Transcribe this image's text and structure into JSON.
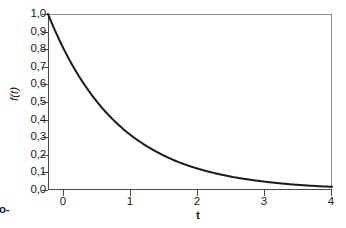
{
  "chart_data": {
    "type": "line",
    "title": "",
    "xlabel": "t",
    "ylabel": "f(t)",
    "xlim": [
      0,
      4
    ],
    "ylim": [
      0.0,
      1.0
    ],
    "grid": false,
    "legend": "none",
    "function": "f(t) = e^(-t)",
    "x_ticks": [
      "0",
      "1",
      "2",
      "3",
      "4"
    ],
    "x_tick_values": [
      0,
      1,
      2,
      3,
      4
    ],
    "y_ticks": [
      "0,0",
      "0,1",
      "0,2",
      "0,3",
      "0,4",
      "0,5",
      "0,6",
      "0,7",
      "0,8",
      "0,9",
      "1,0"
    ],
    "y_tick_values": [
      0.0,
      0.1,
      0.2,
      0.3,
      0.4,
      0.5,
      0.6,
      0.7,
      0.8,
      0.9,
      1.0
    ],
    "series": [
      {
        "name": "f(t) = e^(-t)",
        "color": "#1a1a1a",
        "x": [
          0.0,
          0.2,
          0.4,
          0.6,
          0.8,
          1.0,
          1.2,
          1.4,
          1.6,
          1.8,
          2.0,
          2.2,
          2.4,
          2.6,
          2.8,
          3.0,
          3.2,
          3.4,
          3.6,
          3.8,
          4.0
        ],
        "values": [
          1.0,
          0.819,
          0.67,
          0.549,
          0.449,
          0.368,
          0.301,
          0.247,
          0.202,
          0.165,
          0.135,
          0.111,
          0.091,
          0.074,
          0.061,
          0.05,
          0.041,
          0.033,
          0.027,
          0.022,
          0.018
        ]
      }
    ]
  },
  "axes": {
    "frame_color": "#4a4a4a",
    "top_right_color": "#8d8d8d"
  },
  "caption": {
    "line1": "xpo-",
    "line2": "=1"
  }
}
